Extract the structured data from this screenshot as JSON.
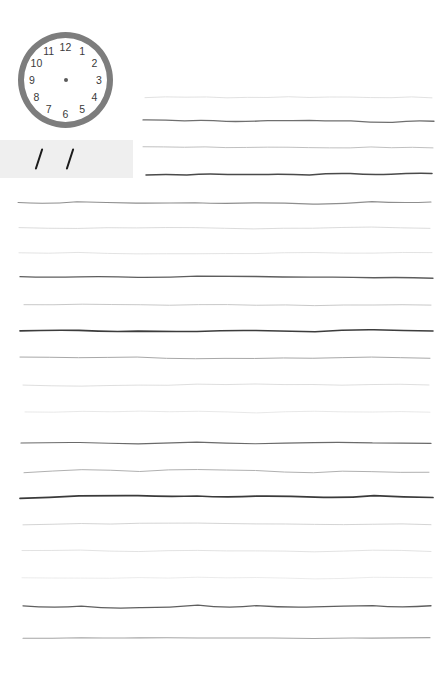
{
  "page": {
    "width": 439,
    "height": 677,
    "background_color": "#ffffff"
  },
  "clock": {
    "label": "analog-clock-face",
    "ring_color": "#7d7d7d",
    "face_color": "#ffffff",
    "center_dot_color": "#5a5a5a",
    "number_color": "#3a3a3a",
    "has_hands": false,
    "numbers": [
      {
        "value": "12",
        "angle_deg": 0
      },
      {
        "value": "1",
        "angle_deg": 30
      },
      {
        "value": "2",
        "angle_deg": 60
      },
      {
        "value": "3",
        "angle_deg": 90
      },
      {
        "value": "4",
        "angle_deg": 120
      },
      {
        "value": "5",
        "angle_deg": 150
      },
      {
        "value": "6",
        "angle_deg": 180
      },
      {
        "value": "7",
        "angle_deg": 210
      },
      {
        "value": "8",
        "angle_deg": 240
      },
      {
        "value": "9",
        "angle_deg": 270
      },
      {
        "value": "10",
        "angle_deg": 300
      },
      {
        "value": "11",
        "angle_deg": 330
      }
    ]
  },
  "gray_band": {
    "label": "gray-scan-band",
    "color": "#efefef",
    "marks": [
      {
        "name": "slash-mark-1",
        "color": "#1b1b1b"
      },
      {
        "name": "slash-mark-2",
        "color": "#1b1b1b"
      }
    ]
  },
  "ruled_lines": [
    {
      "y": 97,
      "x1": 145,
      "x2": 432,
      "color": "#d9d9d9",
      "thickness": 0.8,
      "wave": 2
    },
    {
      "y": 121,
      "x1": 143,
      "x2": 434,
      "color": "#6f6f6f",
      "thickness": 1.3,
      "wave": 3
    },
    {
      "y": 147,
      "x1": 143,
      "x2": 433,
      "color": "#b9b9b9",
      "thickness": 0.9,
      "wave": 2
    },
    {
      "y": 174,
      "x1": 146,
      "x2": 432,
      "color": "#4a4a4a",
      "thickness": 1.5,
      "wave": 2
    },
    {
      "y": 203,
      "x1": 18,
      "x2": 431,
      "color": "#8e8e8e",
      "thickness": 1.1,
      "wave": 3
    },
    {
      "y": 228,
      "x1": 19,
      "x2": 430,
      "color": "#d2d2d2",
      "thickness": 0.8,
      "wave": 2
    },
    {
      "y": 253,
      "x1": 19,
      "x2": 432,
      "color": "#dcdcdc",
      "thickness": 0.8,
      "wave": 2
    },
    {
      "y": 277,
      "x1": 20,
      "x2": 433,
      "color": "#5d5d5d",
      "thickness": 1.3,
      "wave": 3
    },
    {
      "y": 305,
      "x1": 24,
      "x2": 431,
      "color": "#c2c2c2",
      "thickness": 0.9,
      "wave": 2
    },
    {
      "y": 331,
      "x1": 20,
      "x2": 433,
      "color": "#3c3c3c",
      "thickness": 1.6,
      "wave": 3
    },
    {
      "y": 358,
      "x1": 20,
      "x2": 430,
      "color": "#a8a8a8",
      "thickness": 1.0,
      "wave": 2
    },
    {
      "y": 385,
      "x1": 23,
      "x2": 429,
      "color": "#d5d5d5",
      "thickness": 0.8,
      "wave": 3
    },
    {
      "y": 412,
      "x1": 25,
      "x2": 430,
      "color": "#e2e2e2",
      "thickness": 0.8,
      "wave": 2
    },
    {
      "y": 443,
      "x1": 21,
      "x2": 431,
      "color": "#6a6a6a",
      "thickness": 1.2,
      "wave": 2
    },
    {
      "y": 471,
      "x1": 24,
      "x2": 429,
      "color": "#b0b0b0",
      "thickness": 1.0,
      "wave": 4
    },
    {
      "y": 497,
      "x1": 20,
      "x2": 433,
      "color": "#3a3a3a",
      "thickness": 1.7,
      "wave": 3
    },
    {
      "y": 524,
      "x1": 23,
      "x2": 431,
      "color": "#cfcfcf",
      "thickness": 0.9,
      "wave": 2
    },
    {
      "y": 551,
      "x1": 22,
      "x2": 431,
      "color": "#dadada",
      "thickness": 0.8,
      "wave": 2
    },
    {
      "y": 578,
      "x1": 22,
      "x2": 432,
      "color": "#e6e6e6",
      "thickness": 0.8,
      "wave": 2
    },
    {
      "y": 607,
      "x1": 23,
      "x2": 431,
      "color": "#5f5f5f",
      "thickness": 1.3,
      "wave": 4
    },
    {
      "y": 638,
      "x1": 23,
      "x2": 430,
      "color": "#a5a5a5",
      "thickness": 1.1,
      "wave": 1
    }
  ]
}
